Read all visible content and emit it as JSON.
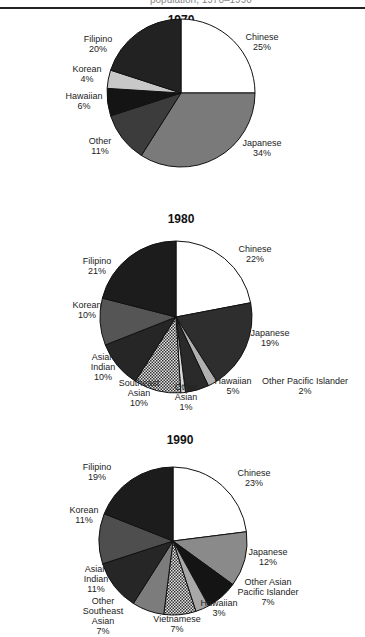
{
  "header": {
    "caption_fragment": "population, 1970–1990"
  },
  "chart_data": [
    {
      "type": "pie",
      "title": "1970",
      "slices": [
        {
          "label": "Chinese",
          "value": 25,
          "fill": "#ffffff"
        },
        {
          "label": "Japanese",
          "value": 34,
          "fill": "#7a7a7a"
        },
        {
          "label": "Other",
          "value": 11,
          "fill": "#3c3c3c"
        },
        {
          "label": "Hawaiian",
          "value": 6,
          "fill": "#141414"
        },
        {
          "label": "Korean",
          "value": 4,
          "fill": "#c8c8c8"
        },
        {
          "label": "Filipino",
          "value": 20,
          "fill": "#222222"
        }
      ]
    },
    {
      "type": "pie",
      "title": "1980",
      "slices": [
        {
          "label": "Chinese",
          "value": 22,
          "fill": "#ffffff"
        },
        {
          "label": "Japanese",
          "value": 19,
          "fill": "#2e2e2e"
        },
        {
          "label": "Other Pacific Islander",
          "value": 2,
          "fill": "#b0b0b0"
        },
        {
          "label": "Hawaiian",
          "value": 5,
          "fill": "#2a2a2a"
        },
        {
          "label": "Other Asian",
          "value": 1,
          "fill": "#d8d8d8"
        },
        {
          "label": "Southeast Asian",
          "value": 10,
          "fill": "pattern"
        },
        {
          "label": "Asian Indian",
          "value": 10,
          "fill": "#262626"
        },
        {
          "label": "Korean",
          "value": 10,
          "fill": "#555555"
        },
        {
          "label": "Filipino",
          "value": 21,
          "fill": "#1c1c1c"
        }
      ]
    },
    {
      "type": "pie",
      "title": "1990",
      "slices": [
        {
          "label": "Chinese",
          "value": 23,
          "fill": "#ffffff"
        },
        {
          "label": "Japanese",
          "value": 12,
          "fill": "#8a8a8a"
        },
        {
          "label": "Other Asian Pacific Islander",
          "value": 7,
          "fill": "#141414"
        },
        {
          "label": "Hawaiian",
          "value": 3,
          "fill": "#a8a8a8"
        },
        {
          "label": "Vietnamese",
          "value": 7,
          "fill": "pattern"
        },
        {
          "label": "Other Southeast Asian",
          "value": 7,
          "fill": "#7c7c7c"
        },
        {
          "label": "Asian Indian",
          "value": 11,
          "fill": "#262626"
        },
        {
          "label": "Korean",
          "value": 11,
          "fill": "#4e4e4e"
        },
        {
          "label": "Filipino",
          "value": 19,
          "fill": "#1c1c1c"
        }
      ]
    }
  ]
}
